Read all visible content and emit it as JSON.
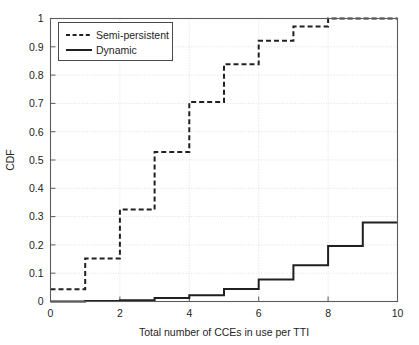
{
  "chart_data": {
    "type": "line",
    "title": "",
    "xlabel": "Total number of CCEs in use per TTI",
    "ylabel": "CDF",
    "xlim": [
      0,
      10
    ],
    "ylim": [
      0,
      1
    ],
    "grid": true,
    "legend_position": "top-left",
    "xticks": [
      "0",
      "2",
      "4",
      "6",
      "8",
      "10"
    ],
    "xtick_values": [
      0,
      2,
      4,
      6,
      8,
      10
    ],
    "yticks": [
      "0",
      "0.1",
      "0.2",
      "0.3",
      "0.4",
      "0.5",
      "0.6",
      "0.7",
      "0.8",
      "0.9",
      "1"
    ],
    "ytick_values": [
      0,
      0.1,
      0.2,
      0.3,
      0.4,
      0.5,
      0.6,
      0.7,
      0.8,
      0.9,
      1.0
    ],
    "x": [
      0,
      1,
      2,
      3,
      4,
      5,
      6,
      7,
      8,
      9,
      10
    ],
    "series": [
      {
        "name": "Semi-persistent",
        "style": "dashed",
        "color": "#202020",
        "values": [
          0.043,
          0.152,
          0.325,
          0.528,
          0.705,
          0.838,
          0.921,
          0.972,
          1.0,
          1.0,
          1.0
        ]
      },
      {
        "name": "Dynamic",
        "style": "solid",
        "color": "#202020",
        "values": [
          0.0,
          0.002,
          0.004,
          0.012,
          0.022,
          0.044,
          0.078,
          0.128,
          0.196,
          0.279,
          0.279
        ]
      }
    ]
  },
  "legend": {
    "entries": [
      {
        "label": "Semi-persistent",
        "style": "dashed"
      },
      {
        "label": "Dynamic",
        "style": "solid"
      }
    ]
  },
  "axes": {
    "x_title": "Total number of CCEs in use per TTI",
    "y_title": "CDF"
  }
}
